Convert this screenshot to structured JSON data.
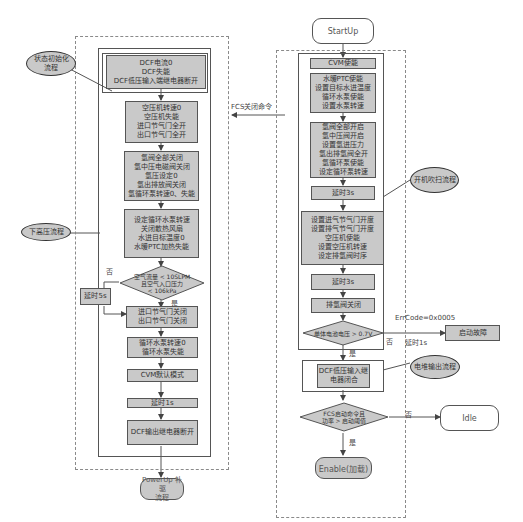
{
  "left_flow": {
    "init_box": "DCF电流0\nDCF失能\nDCF低压输入端继电器断开",
    "compressor_box": "空压机转速0\n空压机失能\n进口节气门全开\n出口节气门全开",
    "valve_box": "氢阀全部关闭\n氢中压电磁阀关闭\n氢压设定0\n氢出排放阀关闭\n氢循环泵转速0、失能",
    "pump_box": "设定循环水泵转速\n关闭散热风扇\n水进目标温度0\n水暖PTC加热失能",
    "decision": "空气流量 < 10SLPM\n且空气入口压力\n< 106kPa",
    "decision_no": "否",
    "decision_yes": "是",
    "delay5": "延时5s",
    "throttle_box": "进口节气门关闭\n出口节气门关闭",
    "water_pump_box": "循环水泵转速0\n循环水泵失能",
    "cvm_default": "CVM默认模式",
    "delay1": "延时1s",
    "dcf_output": "DCF输出继电器断开",
    "powerup": "PowerUp 补驱\n流程"
  },
  "left_annotations": {
    "state_init": "状态初始化\n流程",
    "hv_down": "下高压流程"
  },
  "connector": {
    "fcs_off": "FCS关闭命令"
  },
  "right_flow": {
    "startup": "StartUp",
    "cvm_enable": "CVM使能",
    "ptc_box": "水暖PTC使能\n设置目标水进温度\n循环水泵使能\n设置水泵转速",
    "h2_box": "氢阀全部开启\n氢中压阀开启\n设置氢进压力\n氢出排氢阀全开\n氢循环泵使能\n设定循环泵转速",
    "delay3a": "延时3s",
    "air_box": "设置进气节气门开度\n设置排气节气门开度\n空压机使能\n设置空压机转速\n设定排氢阀时序",
    "delay3b": "延时3s",
    "purge_close": "排氢阀关闭",
    "cell_decision": "单体电池电压 > 0.7V",
    "cell_no": "否",
    "cell_yes": "是",
    "errcode": "ErrCode=0x0005",
    "delay1s": "延时1s",
    "start_fault": "启动故障",
    "dcf_close": "DCF低压输入继\n电器闭合",
    "power_decision": "FCS启动命令且\n功率 > 启动阈值",
    "power_no": "否",
    "power_yes": "是",
    "idle": "Idle",
    "enable": "Enable(加载)"
  },
  "right_annotations": {
    "startup_purge": "开机吹扫流程",
    "stack_output": "电堆输出流程"
  },
  "colors": {
    "box_fill": "#c9c9c9",
    "line": "#555555",
    "dash": "#8a8a8a"
  }
}
